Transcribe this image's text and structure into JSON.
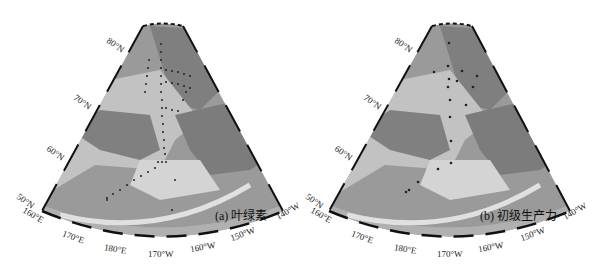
{
  "figure": {
    "panels": [
      {
        "id": "a",
        "caption": "(a) 叶绿素",
        "lat_labels": [
          "80°N",
          "70°N",
          "60°N",
          "50°N"
        ],
        "lon_labels": [
          "160°E",
          "170°E",
          "180°E",
          "170°W",
          "160°W",
          "150°W",
          "140°W"
        ]
      },
      {
        "id": "b",
        "caption": "(b) 初级生产力",
        "lat_labels": [
          "80°N",
          "70°N",
          "60°N",
          "50°N"
        ],
        "lon_labels": [
          "160°E",
          "170°E",
          "180°E",
          "170°W",
          "160°W",
          "150°W",
          "140°W"
        ]
      }
    ],
    "colors": {
      "ocean_deep": "#8e8e8e",
      "ocean_shelf": "#c9c9c9",
      "land": "#7a7a7a",
      "station": "#222222",
      "frame": "#111111"
    }
  }
}
